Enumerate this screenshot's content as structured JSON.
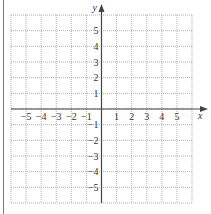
{
  "chart_data": {
    "type": "scatter",
    "title": "",
    "xlabel": "x",
    "ylabel": "y",
    "xlim": [
      -6,
      6
    ],
    "ylim": [
      -6,
      6
    ],
    "grid": true,
    "grid_style": "dotted",
    "x_ticks": [
      -5,
      -4,
      -3,
      -2,
      -1,
      1,
      2,
      3,
      4,
      5
    ],
    "y_ticks": [
      -5,
      -4,
      -3,
      -2,
      -1,
      1,
      2,
      3,
      4,
      5
    ],
    "x_tick_labels": [
      "−5",
      "−4",
      "−3",
      "−2",
      "−1",
      "1",
      "2",
      "3",
      "4",
      "5"
    ],
    "y_tick_labels": [
      "−5",
      "−4",
      "−3",
      "−2",
      "−1",
      "1",
      "2",
      "3",
      "4",
      "5"
    ],
    "series": []
  },
  "colors": {
    "axis": "#444444",
    "grid": "#9a9a9a",
    "left_bar": "#7a7a7a"
  },
  "geometry": {
    "left": 11,
    "right": 192,
    "top": 15,
    "bottom": 203,
    "origin_x": 101,
    "origin_y": 109
  }
}
